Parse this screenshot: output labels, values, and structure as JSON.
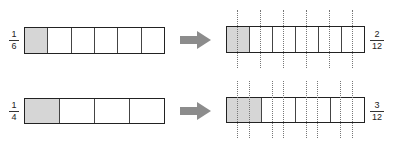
{
  "colors": {
    "outline": "#222222",
    "shade": "#d6d6d6",
    "arrow": "#8c8c8c",
    "dots": "#777777"
  },
  "rows": [
    {
      "left_fraction": {
        "numerator": "1",
        "denominator": "6"
      },
      "left_parts": 6,
      "left_shaded": 1,
      "arrow_icon": "right-arrow-icon",
      "right_parts": 6,
      "right_shaded": 1,
      "subdivisions_per_part": 2,
      "right_fraction": {
        "numerator": "2",
        "denominator": "12"
      }
    },
    {
      "left_fraction": {
        "numerator": "1",
        "denominator": "4"
      },
      "left_parts": 4,
      "left_shaded": 1,
      "arrow_icon": "right-arrow-icon",
      "right_parts": 4,
      "right_shaded": 1,
      "subdivisions_per_part": 3,
      "right_fraction": {
        "numerator": "3",
        "denominator": "12"
      }
    }
  ]
}
